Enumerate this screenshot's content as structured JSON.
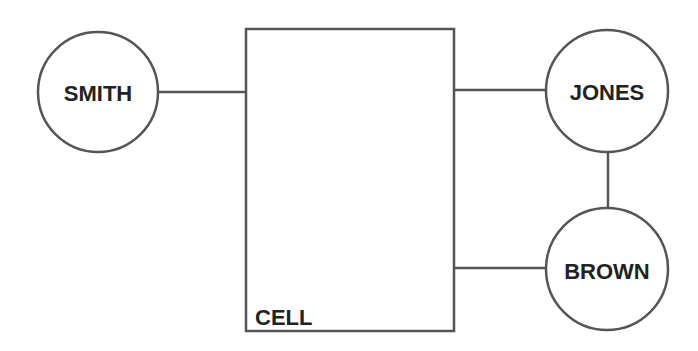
{
  "diagram": {
    "colors": {
      "stroke": "#555555",
      "text": "#222222",
      "background": "#ffffff"
    },
    "box": {
      "label": "CELL"
    },
    "nodes": [
      {
        "id": "smith",
        "label": "SMITH"
      },
      {
        "id": "jones",
        "label": "JONES"
      },
      {
        "id": "brown",
        "label": "BROWN"
      }
    ],
    "edges": [
      {
        "from": "smith",
        "to": "cell"
      },
      {
        "from": "cell",
        "to": "jones"
      },
      {
        "from": "cell",
        "to": "brown"
      },
      {
        "from": "jones",
        "to": "brown"
      }
    ]
  }
}
